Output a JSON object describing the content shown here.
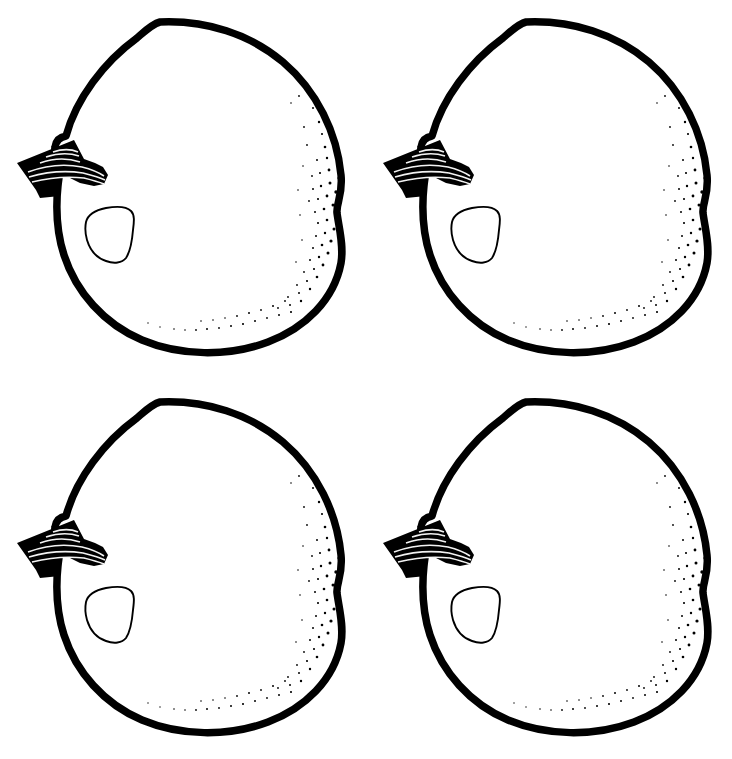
{
  "page": {
    "background_color": "#ffffff",
    "ink_color": "#000000",
    "width": 732,
    "height": 759
  },
  "artwork": {
    "subject": "apple",
    "style": "line-art-outline",
    "repeat_count": 4,
    "grid": {
      "rows": 2,
      "columns": 2
    },
    "parts": [
      {
        "name": "apple-body-outline",
        "label": "Apple body outline"
      },
      {
        "name": "apple-stem",
        "label": "Apple stem"
      },
      {
        "name": "apple-highlight",
        "label": "Apple highlight"
      },
      {
        "name": "apple-stipple-shading",
        "label": "Stipple shading"
      }
    ]
  },
  "apples": [
    {
      "id": "apple-1",
      "position": "top-left",
      "row": 1,
      "column": 1
    },
    {
      "id": "apple-2",
      "position": "top-right",
      "row": 1,
      "column": 2
    },
    {
      "id": "apple-3",
      "position": "bottom-left",
      "row": 2,
      "column": 1
    },
    {
      "id": "apple-4",
      "position": "bottom-right",
      "row": 2,
      "column": 2
    }
  ]
}
